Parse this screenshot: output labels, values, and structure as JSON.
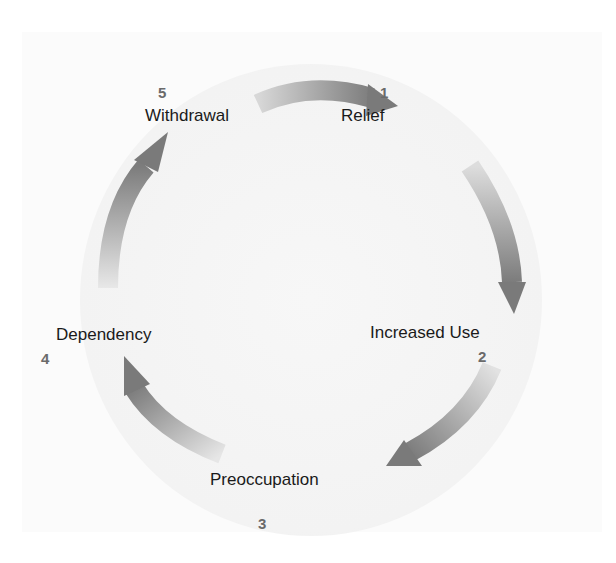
{
  "diagram": {
    "type": "cycle",
    "stages": [
      {
        "number": "1",
        "label": "Relief"
      },
      {
        "number": "2",
        "label": "Increased Use"
      },
      {
        "number": "3",
        "label": "Preoccupation"
      },
      {
        "number": "4",
        "label": "Dependency"
      },
      {
        "number": "5",
        "label": "Withdrawal"
      }
    ],
    "arrow_color": "#7a7a7a",
    "circle_color": "#efefef",
    "flow": [
      "5 → 1",
      "1 → 2",
      "2 → 3",
      "3 → 4",
      "4 → 5"
    ]
  }
}
